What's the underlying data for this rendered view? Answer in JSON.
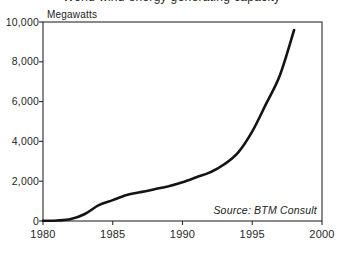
{
  "figure": {
    "cropped_title": "World wind energy generating capacity"
  },
  "chart_data": {
    "type": "line",
    "title": "World wind energy generating capacity",
    "ylabel": "Megawatts",
    "xlabel": "",
    "source": "Source: BTM Consult",
    "series_name": "Wind energy generating capacity (megawatts)",
    "x": [
      1980,
      1981,
      1982,
      1983,
      1984,
      1985,
      1986,
      1987,
      1988,
      1989,
      1990,
      1991,
      1992,
      1993,
      1994,
      1995,
      1996,
      1997,
      1998
    ],
    "values": [
      10,
      25,
      100,
      350,
      800,
      1050,
      1300,
      1450,
      1600,
      1750,
      1950,
      2200,
      2450,
      2850,
      3450,
      4500,
      5900,
      7350,
      9600
    ],
    "xlim": [
      1980,
      2000
    ],
    "ylim": [
      0,
      10000
    ],
    "x_ticks": [
      {
        "value": 1980,
        "label": "1980"
      },
      {
        "value": 1985,
        "label": "1985"
      },
      {
        "value": 1990,
        "label": "1990"
      },
      {
        "value": 1995,
        "label": "1995"
      },
      {
        "value": 2000,
        "label": "2000"
      }
    ],
    "y_ticks": [
      {
        "value": 0,
        "label": "0"
      },
      {
        "value": 2000,
        "label": "2,000"
      },
      {
        "value": 4000,
        "label": "4,000"
      },
      {
        "value": 6000,
        "label": "6,000"
      },
      {
        "value": 8000,
        "label": "8,000"
      },
      {
        "value": 10000,
        "label": "10,000"
      }
    ],
    "grid": false,
    "legend": "none",
    "line_color": "#141414",
    "frame_color": "#2b2b2b",
    "background_color": "#ffffff"
  }
}
